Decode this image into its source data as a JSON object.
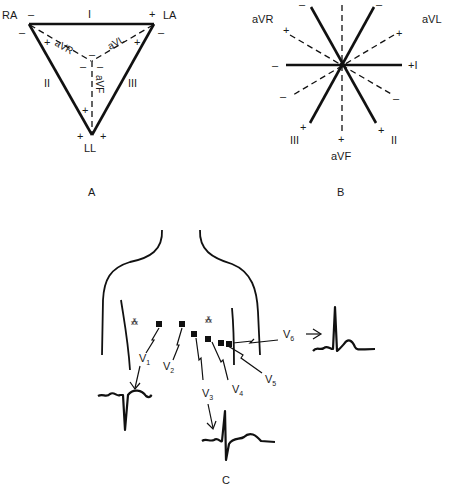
{
  "panel_a": {
    "caption": "A",
    "electrodes": {
      "ra": "RA",
      "la": "LA",
      "ll": "LL"
    },
    "leads": {
      "i": "I",
      "ii": "II",
      "iii": "III",
      "avr": "aVR",
      "avl": "aVL",
      "avf": "aVF"
    },
    "plus": "+",
    "minus": "–"
  },
  "panel_b": {
    "caption": "B",
    "labels": {
      "avr": "aVR",
      "avl": "aVL",
      "i": "+I",
      "iii": "III",
      "ii": "II",
      "avf": "aVF"
    },
    "plus": "+",
    "minus": "–"
  },
  "panel_c": {
    "caption": "C",
    "leads": {
      "v1": "V",
      "v2": "V",
      "v3": "V",
      "v4": "V",
      "v5": "V",
      "v6": "V"
    },
    "subscripts": {
      "v1": "1",
      "v2": "2",
      "v3": "3",
      "v4": "4",
      "v5": "5",
      "v6": "6"
    }
  }
}
